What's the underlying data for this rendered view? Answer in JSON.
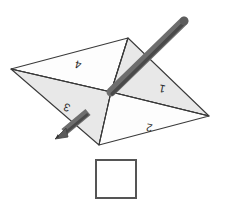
{
  "diagram": {
    "type": "paper-folding-puzzle",
    "colors": {
      "outline": "#3a3a3a",
      "fill_light": "#e8e8e8",
      "fill_white": "#fdfdfd",
      "fill_mid": "#dedede",
      "pencil_body": "#6e6e6e",
      "pencil_dark": "#4a4a4a",
      "pencil_tip": "#5a5a5a",
      "label_text": "#2b2b2b",
      "answer_box_border": "#555555",
      "answer_box_fill": "#ffffff",
      "background": "#ffffff"
    },
    "vertices": {
      "top": {
        "x": 128,
        "y": 38
      },
      "left": {
        "x": 11,
        "y": 69
      },
      "right": {
        "x": 209,
        "y": 116
      },
      "bottom": {
        "x": 99,
        "y": 145
      },
      "center": {
        "x": 111,
        "y": 92
      }
    },
    "flaps": [
      {
        "id": "flap-1",
        "label": "1",
        "label_x": 163,
        "label_y": 85,
        "rotation": -168,
        "shade": "light"
      },
      {
        "id": "flap-2",
        "label": "2",
        "label_x": 150,
        "label_y": 124,
        "rotation": -170,
        "shade": "white"
      },
      {
        "id": "flap-3",
        "label": "3",
        "label_x": 68,
        "label_y": 104,
        "rotation": -160,
        "shade": "light"
      },
      {
        "id": "flap-4",
        "label": "4",
        "label_x": 79,
        "label_y": 61,
        "rotation": -166,
        "shade": "white"
      }
    ],
    "pencil": {
      "label": "pencil",
      "tail_x": 184,
      "tail_y": 21,
      "through_x": 111,
      "through_y": 92,
      "tip_x": 56,
      "tip_y": 137
    },
    "answer_box": {
      "label": "",
      "x": 96,
      "y": 160,
      "width": 40,
      "height": 38
    }
  }
}
